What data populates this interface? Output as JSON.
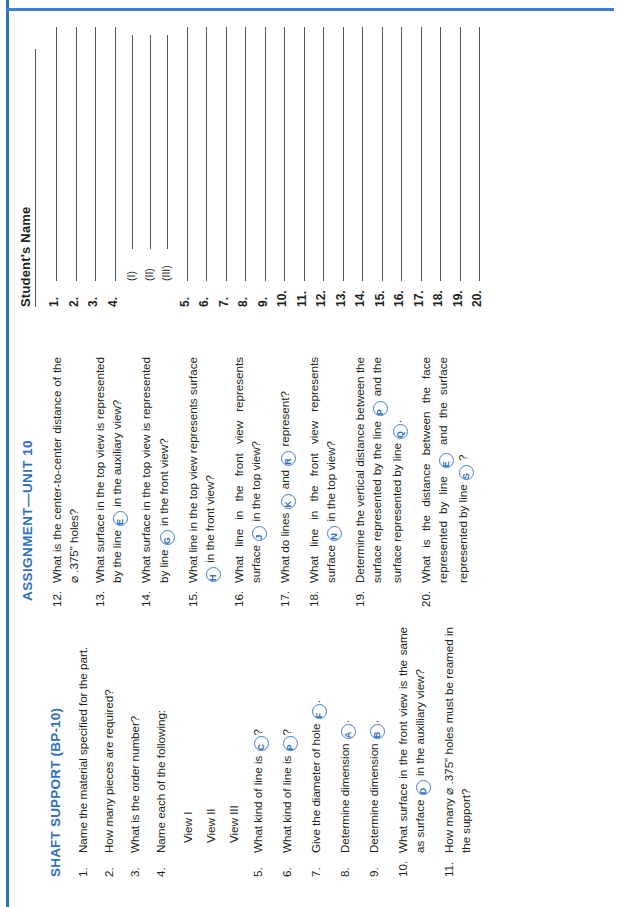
{
  "page": {
    "assignment_title": "ASSIGNMENT—UNIT 10",
    "section_title": "SHAFT SUPPORT (BP-10)",
    "accent_color": "#2f6fc0",
    "rule_color": "#58595b",
    "text_color": "#231f20"
  },
  "questions_left": [
    {
      "num": "1.",
      "text_a": "Name the material specified for the",
      "text_b": "part."
    },
    {
      "num": "2.",
      "text_a": "How many pieces are required?",
      "text_b": ""
    },
    {
      "num": "3.",
      "text_a": "What is the order number?",
      "text_b": ""
    },
    {
      "num": "4.",
      "text_a": "Name each of the following:",
      "text_b": ""
    },
    {
      "num": "5.",
      "pre": "What kind of line is ",
      "tok": "C",
      "post": "?"
    },
    {
      "num": "6.",
      "pre": "What kind of line is ",
      "tok": "P",
      "post": "?"
    },
    {
      "num": "7.",
      "pre": "Give the diameter of hole ",
      "tok": "F",
      "post": "."
    },
    {
      "num": "8.",
      "pre": "Determine dimension ",
      "tok": "A",
      "post": "."
    },
    {
      "num": "9.",
      "pre": "Determine dimension ",
      "tok": "B",
      "post": "."
    },
    {
      "num": "10.",
      "pre": "What surface in the front view is the same as surface ",
      "tok": "D",
      "post": " in the auxiliary view?"
    },
    {
      "num": "11.",
      "pre": "How many ⌀ .375\" holes must be reamed in the support?",
      "tok": "",
      "post": ""
    }
  ],
  "sub_views": [
    "View I",
    "View II",
    "View III"
  ],
  "questions_right": [
    {
      "num": "12.",
      "pre": "What is the center-to-center distance of the ⌀ .375\" holes?",
      "tok": "",
      "post": ""
    },
    {
      "num": "13.",
      "pre": "What surface in the top view is represented by the line ",
      "tok": "E",
      "post": " in the auxiliary view?"
    },
    {
      "num": "14.",
      "pre": "What surface in the top view is represented by line ",
      "tok": "G",
      "post": " in the front view?"
    },
    {
      "num": "15.",
      "pre": "What line in the top view represents surface ",
      "tok": "H",
      "post": " in the front view?"
    },
    {
      "num": "16.",
      "pre": "What line in the front view represents surface ",
      "tok": "J",
      "post": " in the top view?"
    },
    {
      "num": "17.",
      "pre": "What do lines ",
      "tok": "K",
      "mid": " and ",
      "tok2": "R",
      "post": " represent?"
    },
    {
      "num": "18.",
      "pre": "What line in the front view represents surface ",
      "tok": "N",
      "post": " in the top view?"
    },
    {
      "num": "19.",
      "pre": "Determine the vertical distance between the surface represented by the line ",
      "tok": "P",
      "mid": " and the surface represented by line ",
      "tok2": "Q",
      "post": "."
    },
    {
      "num": "20.",
      "pre": "What is the distance between the face represented by line ",
      "tok": "E",
      "mid": " and the surface represented by line ",
      "tok2": "S",
      "post": " ?"
    }
  ],
  "answers": {
    "name_label": "Student's Name",
    "rows": [
      {
        "label": "1."
      },
      {
        "label": "2."
      },
      {
        "label": "3."
      },
      {
        "label": "4."
      },
      {
        "label": "(I)",
        "sub": true
      },
      {
        "label": "(II)",
        "sub": true
      },
      {
        "label": "(III)",
        "sub": true
      },
      {
        "label": "5."
      },
      {
        "label": "6."
      },
      {
        "label": "7."
      },
      {
        "label": "8."
      },
      {
        "label": "9."
      },
      {
        "label": "10."
      },
      {
        "label": "11."
      },
      {
        "label": "12."
      },
      {
        "label": "13."
      },
      {
        "label": "14."
      },
      {
        "label": "15."
      },
      {
        "label": "16."
      },
      {
        "label": "17."
      },
      {
        "label": "18."
      },
      {
        "label": "19."
      },
      {
        "label": "20."
      }
    ]
  }
}
